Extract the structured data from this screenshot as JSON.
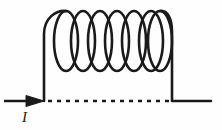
{
  "figure": {
    "kind": "solenoid-current-diagram",
    "background_color": "#fefefe",
    "stroke_color": "#1a1a1a",
    "canvas": {
      "width": 222,
      "height": 130
    }
  },
  "labels": {
    "current": "I"
  },
  "geometry": {
    "coil": {
      "turns": 7,
      "loop_rx": 12,
      "loop_ry": 30,
      "pitch": 17,
      "first_center_x": 66,
      "center_y": 41,
      "top_y": 11,
      "bottom_y": 72,
      "left_x": 53,
      "right_x": 170,
      "stroke_width": 2.6
    },
    "left_lead": {
      "x": 44,
      "top_y": 22,
      "bottom_y": 101,
      "stroke_width": 2.6
    },
    "right_lead": {
      "x": 172,
      "top_y": 22,
      "bottom_y": 101,
      "end_x": 211,
      "stroke_width": 2.6
    },
    "axis_dashed_line": {
      "x1": 48,
      "x2": 170,
      "y": 101,
      "dash": "4 5",
      "stroke_width": 2.4
    },
    "current_arrow": {
      "tail_x": 4,
      "tip_x": 44,
      "y": 101,
      "head_width": 16,
      "head_height": 11,
      "stroke_width": 2.6
    },
    "current_label_pos": {
      "x": 22,
      "y": 110
    }
  }
}
